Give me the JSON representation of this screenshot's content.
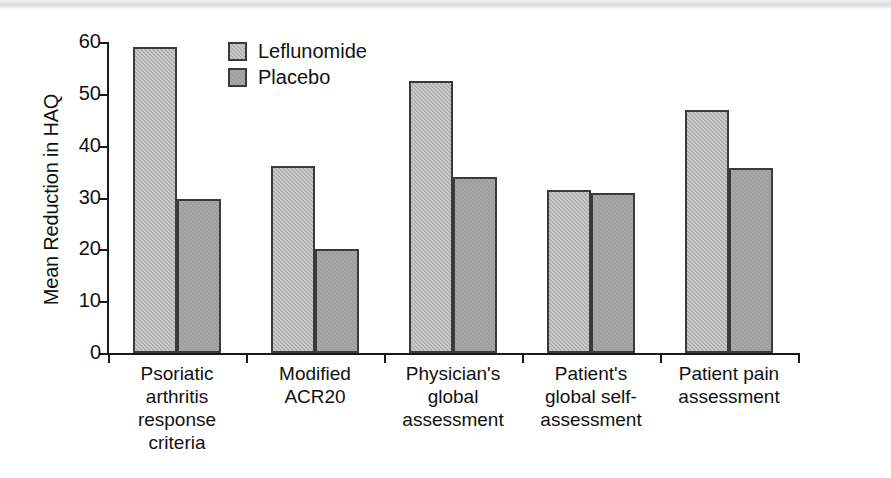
{
  "chart_data": {
    "type": "bar",
    "title": "",
    "subtitle": "",
    "xlabel": "",
    "ylabel": "Mean Reduction in HAQ",
    "ylim": [
      0,
      60
    ],
    "yticks": [
      0,
      10,
      20,
      30,
      40,
      50,
      60
    ],
    "ytick_labels": [
      "0",
      "10",
      "20",
      "30",
      "40",
      "50",
      "60"
    ],
    "grid": false,
    "legend_position": "top-left-inside",
    "categories": [
      "Psoriatic\narthritis\nresponse\ncriteria",
      "Modified\nACR20",
      "Physician's\nglobal\nassessment",
      "Patient's\nglobal self-\nassessment",
      "Patient pain\nassessment"
    ],
    "series": [
      {
        "name": "Leflunomide",
        "color": "#c9c9c9",
        "values": [
          59.0,
          36.0,
          52.5,
          31.5,
          46.8
        ]
      },
      {
        "name": "Placebo",
        "color": "#a9a9a9",
        "values": [
          29.8,
          20.1,
          34.0,
          30.8,
          35.6
        ]
      }
    ]
  },
  "legend": {
    "items": [
      {
        "label": "Leflunomide",
        "swatch_name": "legend-swatch-leflunomide"
      },
      {
        "label": "Placebo",
        "swatch_name": "legend-swatch-placebo"
      }
    ]
  }
}
